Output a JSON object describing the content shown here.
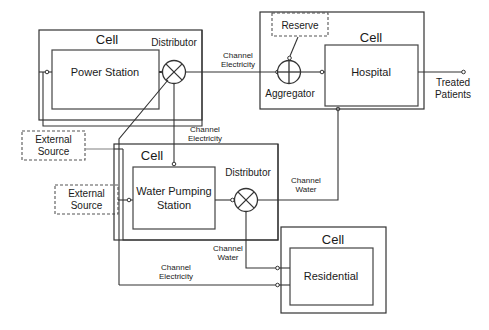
{
  "diagram": {
    "cells": [
      {
        "id": "cell-power",
        "cell_label": "Cell",
        "node_label": "Power  Station"
      },
      {
        "id": "cell-hospital",
        "cell_label": "Cell",
        "node_label": "Hospital"
      },
      {
        "id": "cell-water",
        "cell_label": "Cell",
        "node_label": "Water Pumping\nStation"
      },
      {
        "id": "cell-residential",
        "cell_label": "Cell",
        "node_label": "Residential"
      }
    ],
    "node_labels": {
      "power_station": "Power  Station",
      "hospital": "Hospital",
      "water_pumping_station_line1": "Water Pumping",
      "water_pumping_station_line2": "Station",
      "residential": "Residential"
    },
    "cell_label": "Cell",
    "components": {
      "distributor_power": "Distributor",
      "distributor_water": "Distributor",
      "aggregator": "Aggregator",
      "reserve": "Reserve",
      "external_source_1": "External\nSource",
      "external_source_2": "External\nSource",
      "external_source_line1": "External",
      "external_source_line2": "Source"
    },
    "channels": {
      "power_to_aggregator_line1": "Channel",
      "power_to_aggregator_line2": "Electricity",
      "power_to_water_line1": "Channel",
      "power_to_water_line2": "Electricity",
      "water_to_hospital_line1": "Channel",
      "water_to_hospital_line2": "Water",
      "water_to_residential_line1": "Channel",
      "water_to_residential_line2": "Water",
      "electricity_to_residential_line1": "Channel",
      "electricity_to_residential_line2": "Electricity"
    },
    "outputs": {
      "treated_patients_line1": "Treated",
      "treated_patients_line2": "Patients"
    },
    "colors": {
      "stroke": "#333333",
      "faint_stroke": "#8a8a8a",
      "text": "#1a1a1a",
      "background": "#ffffff"
    }
  }
}
